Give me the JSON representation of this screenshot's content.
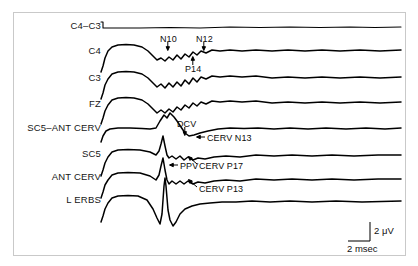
{
  "figure": {
    "background": "#ffffff",
    "frame_color": "#c9c9c9",
    "trace_color": "#000000"
  },
  "channels": [
    {
      "label": "C4–C3",
      "y": 27
    },
    {
      "label": "C4",
      "y": 52
    },
    {
      "label": "C3",
      "y": 79
    },
    {
      "label": "FZ",
      "y": 105
    },
    {
      "label": "SC5–ANT CERV",
      "y": 129
    },
    {
      "label": "SC5",
      "y": 155
    },
    {
      "label": "ANT CERV",
      "y": 178
    },
    {
      "label": "L ERBS",
      "y": 201
    }
  ],
  "annotations": [
    {
      "text": "N10",
      "x": 160,
      "y": 40,
      "arrow": "down"
    },
    {
      "text": "N12",
      "x": 196,
      "y": 40,
      "arrow": "down"
    },
    {
      "text": "P14",
      "x": 185,
      "y": 70,
      "arrow": "up"
    },
    {
      "text": "DCV",
      "x": 177,
      "y": 125,
      "arrow": "down"
    },
    {
      "text": "CERV N13",
      "x": 207,
      "y": 139,
      "arrow": "left"
    },
    {
      "text": "PPV",
      "x": 180,
      "y": 167,
      "arrow": "left"
    },
    {
      "text": "CERV P17",
      "x": 199,
      "y": 167,
      "arrow": "upleft"
    },
    {
      "text": "CERV P13",
      "x": 199,
      "y": 190,
      "arrow": "upleft"
    }
  ],
  "scale_bar": {
    "amplitude_label": "2 μV",
    "time_label": "2 msec",
    "vertical_x": 370,
    "vertical_top": 222,
    "vertical_bottom": 241,
    "horizontal_left": 348,
    "amplitude_text_x": 374,
    "amplitude_text_y": 225,
    "time_text_x": 347,
    "time_text_y": 243
  },
  "chart_data": {
    "type": "line",
    "title": "",
    "xlabel": "",
    "ylabel": "",
    "legend": "none",
    "grid": false,
    "x_scale_unit": "msec",
    "y_scale_unit": "μV",
    "x_scale_per_division": 2,
    "y_scale_per_division": 2,
    "stimulus_onset_x": 103,
    "trace_start_x": 101,
    "trace_end_x": 401,
    "series": [
      {
        "name": "C4–C3",
        "baseline_y": 27,
        "points": [
          [
            101,
            22
          ],
          [
            103,
            22
          ],
          [
            103,
            28
          ],
          [
            112,
            28
          ],
          [
            140,
            28
          ],
          [
            170,
            27.5
          ],
          [
            200,
            28
          ],
          [
            230,
            27
          ],
          [
            260,
            27.5
          ],
          [
            290,
            27
          ],
          [
            320,
            27.5
          ],
          [
            350,
            27
          ],
          [
            375,
            27.5
          ],
          [
            401,
            27
          ]
        ]
      },
      {
        "name": "C4",
        "baseline_y": 52,
        "points": [
          [
            101,
            72
          ],
          [
            103,
            66
          ],
          [
            105,
            58
          ],
          [
            108,
            51
          ],
          [
            112,
            47
          ],
          [
            118,
            45
          ],
          [
            126,
            44.5
          ],
          [
            134,
            45
          ],
          [
            142,
            47
          ],
          [
            148,
            51
          ],
          [
            153,
            56
          ],
          [
            157,
            60
          ],
          [
            161,
            58
          ],
          [
            165,
            61
          ],
          [
            169,
            57
          ],
          [
            173,
            60
          ],
          [
            177,
            55
          ],
          [
            181,
            59
          ],
          [
            185,
            54
          ],
          [
            189,
            57
          ],
          [
            193,
            52
          ],
          [
            197,
            55
          ],
          [
            201,
            51
          ],
          [
            206,
            53
          ],
          [
            212,
            50
          ],
          [
            220,
            51
          ],
          [
            230,
            50
          ],
          [
            242,
            51
          ],
          [
            256,
            50
          ],
          [
            272,
            51
          ],
          [
            288,
            50
          ],
          [
            305,
            51
          ],
          [
            322,
            50
          ],
          [
            340,
            51
          ],
          [
            360,
            50
          ],
          [
            380,
            51
          ],
          [
            401,
            50
          ]
        ]
      },
      {
        "name": "C3",
        "baseline_y": 79,
        "points": [
          [
            101,
            99
          ],
          [
            103,
            93
          ],
          [
            105,
            85
          ],
          [
            108,
            79
          ],
          [
            112,
            74
          ],
          [
            118,
            72
          ],
          [
            126,
            71.5
          ],
          [
            134,
            72
          ],
          [
            142,
            74
          ],
          [
            148,
            78
          ],
          [
            153,
            83
          ],
          [
            157,
            87
          ],
          [
            161,
            84
          ],
          [
            165,
            88
          ],
          [
            169,
            83
          ],
          [
            173,
            87
          ],
          [
            177,
            82
          ],
          [
            181,
            86
          ],
          [
            185,
            80
          ],
          [
            189,
            84
          ],
          [
            193,
            78
          ],
          [
            197,
            82
          ],
          [
            201,
            77
          ],
          [
            206,
            79
          ],
          [
            212,
            76
          ],
          [
            220,
            77
          ],
          [
            230,
            76
          ],
          [
            242,
            77
          ],
          [
            256,
            76
          ],
          [
            272,
            78
          ],
          [
            288,
            77
          ],
          [
            305,
            78
          ],
          [
            322,
            77
          ],
          [
            340,
            78
          ],
          [
            360,
            77
          ],
          [
            380,
            78
          ],
          [
            401,
            77
          ]
        ]
      },
      {
        "name": "FZ",
        "baseline_y": 105,
        "points": [
          [
            101,
            124
          ],
          [
            103,
            118
          ],
          [
            105,
            111
          ],
          [
            108,
            105
          ],
          [
            112,
            100
          ],
          [
            118,
            98
          ],
          [
            126,
            97.5
          ],
          [
            134,
            98
          ],
          [
            142,
            100
          ],
          [
            148,
            104
          ],
          [
            153,
            109
          ],
          [
            157,
            113
          ],
          [
            161,
            110
          ],
          [
            165,
            113
          ],
          [
            169,
            109
          ],
          [
            173,
            112
          ],
          [
            177,
            107
          ],
          [
            181,
            110
          ],
          [
            185,
            105
          ],
          [
            189,
            108
          ],
          [
            193,
            103
          ],
          [
            197,
            106
          ],
          [
            201,
            102
          ],
          [
            206,
            104
          ],
          [
            212,
            101
          ],
          [
            220,
            102
          ],
          [
            230,
            101
          ],
          [
            242,
            102
          ],
          [
            256,
            101
          ],
          [
            272,
            103
          ],
          [
            288,
            102
          ],
          [
            305,
            103
          ],
          [
            322,
            102
          ],
          [
            340,
            103
          ],
          [
            360,
            102
          ],
          [
            380,
            103
          ],
          [
            401,
            102
          ]
        ]
      },
      {
        "name": "SC5–ANT CERV",
        "baseline_y": 129,
        "points": [
          [
            101,
            142
          ],
          [
            103,
            136
          ],
          [
            106,
            131
          ],
          [
            110,
            129
          ],
          [
            118,
            128
          ],
          [
            130,
            128
          ],
          [
            142,
            128.5
          ],
          [
            150,
            129
          ],
          [
            156,
            128
          ],
          [
            160,
            121
          ],
          [
            164,
            115
          ],
          [
            167,
            118
          ],
          [
            170,
            113
          ],
          [
            174,
            117
          ],
          [
            177,
            121
          ],
          [
            181,
            127
          ],
          [
            185,
            133
          ],
          [
            189,
            136
          ],
          [
            194,
            135
          ],
          [
            200,
            133
          ],
          [
            208,
            131
          ],
          [
            218,
            129
          ],
          [
            230,
            128
          ],
          [
            244,
            128.5
          ],
          [
            258,
            128
          ],
          [
            274,
            129
          ],
          [
            290,
            128
          ],
          [
            308,
            129
          ],
          [
            326,
            128
          ],
          [
            346,
            129
          ],
          [
            366,
            128
          ],
          [
            385,
            129
          ],
          [
            401,
            128
          ]
        ]
      },
      {
        "name": "SC5",
        "baseline_y": 155,
        "points": [
          [
            101,
            176
          ],
          [
            103,
            170
          ],
          [
            105,
            163
          ],
          [
            108,
            157
          ],
          [
            112,
            152
          ],
          [
            118,
            150
          ],
          [
            128,
            149.5
          ],
          [
            140,
            150
          ],
          [
            150,
            152
          ],
          [
            156,
            155
          ],
          [
            159,
            151
          ],
          [
            161,
            144
          ],
          [
            163,
            136
          ],
          [
            165,
            146
          ],
          [
            167,
            155
          ],
          [
            169,
            158
          ],
          [
            172,
            156
          ],
          [
            176,
            159
          ],
          [
            180,
            156
          ],
          [
            184,
            160
          ],
          [
            188,
            157
          ],
          [
            193,
            160
          ],
          [
            198,
            158
          ],
          [
            205,
            159
          ],
          [
            214,
            157
          ],
          [
            226,
            156
          ],
          [
            240,
            157
          ],
          [
            256,
            155
          ],
          [
            274,
            156
          ],
          [
            292,
            155
          ],
          [
            312,
            156
          ],
          [
            332,
            155
          ],
          [
            354,
            156
          ],
          [
            378,
            155
          ],
          [
            401,
            155
          ]
        ]
      },
      {
        "name": "ANT CERV",
        "baseline_y": 178,
        "points": [
          [
            101,
            198
          ],
          [
            103,
            192
          ],
          [
            105,
            185
          ],
          [
            108,
            180
          ],
          [
            112,
            175
          ],
          [
            118,
            173
          ],
          [
            128,
            172.5
          ],
          [
            140,
            173
          ],
          [
            150,
            176
          ],
          [
            156,
            180
          ],
          [
            159,
            175
          ],
          [
            161,
            166
          ],
          [
            163,
            158
          ],
          [
            165,
            170
          ],
          [
            167,
            180
          ],
          [
            169,
            184
          ],
          [
            172,
            181
          ],
          [
            176,
            184
          ],
          [
            180,
            181
          ],
          [
            184,
            184
          ],
          [
            188,
            181
          ],
          [
            193,
            184
          ],
          [
            198,
            182
          ],
          [
            205,
            183
          ],
          [
            214,
            181
          ],
          [
            226,
            180
          ],
          [
            240,
            181
          ],
          [
            256,
            179
          ],
          [
            274,
            180
          ],
          [
            292,
            179
          ],
          [
            312,
            180
          ],
          [
            332,
            179
          ],
          [
            354,
            180
          ],
          [
            378,
            179
          ],
          [
            401,
            179
          ]
        ]
      },
      {
        "name": "L ERBS",
        "baseline_y": 201,
        "points": [
          [
            101,
            222
          ],
          [
            103,
            216
          ],
          [
            105,
            209
          ],
          [
            108,
            203
          ],
          [
            112,
            198
          ],
          [
            118,
            196
          ],
          [
            128,
            195.5
          ],
          [
            138,
            196
          ],
          [
            147,
            200
          ],
          [
            153,
            209
          ],
          [
            157,
            218
          ],
          [
            160,
            224
          ],
          [
            162,
            214
          ],
          [
            163,
            200
          ],
          [
            164,
            186
          ],
          [
            165,
            178
          ],
          [
            166,
            186
          ],
          [
            167,
            198
          ],
          [
            168,
            210
          ],
          [
            170,
            220
          ],
          [
            173,
            226
          ],
          [
            176,
            222
          ],
          [
            180,
            214
          ],
          [
            185,
            209
          ],
          [
            192,
            206
          ],
          [
            200,
            204
          ],
          [
            210,
            203
          ],
          [
            222,
            202
          ],
          [
            236,
            202
          ],
          [
            252,
            201
          ],
          [
            270,
            202
          ],
          [
            290,
            201
          ],
          [
            312,
            202
          ],
          [
            336,
            201
          ],
          [
            362,
            202
          ],
          [
            401,
            201
          ]
        ]
      }
    ]
  }
}
